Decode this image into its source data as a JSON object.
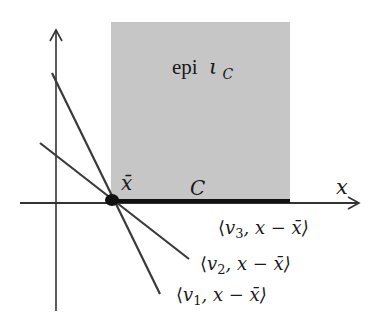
{
  "figure": {
    "colors": {
      "region_fill": "#c6c6c6",
      "line": "#3a3a3a",
      "axis": "#333333",
      "segment": "#111111",
      "point": "#111111",
      "text": "#1a1a1a"
    },
    "region": {
      "label_main": "epi",
      "label_symbol": "ι",
      "label_sub": "C",
      "x": 111,
      "y": 22,
      "width": 179,
      "height": 179
    },
    "axes": {
      "x_label": "x",
      "x_start": [
        20,
        203
      ],
      "x_end": [
        359,
        203
      ],
      "y_start": [
        56,
        311
      ],
      "y_end": [
        56,
        30
      ]
    },
    "set": {
      "label": "C",
      "segment_start": [
        112,
        201
      ],
      "segment_end": [
        290,
        201
      ]
    },
    "point": {
      "label": "x̄",
      "center": [
        112,
        200
      ]
    },
    "lines": [
      {
        "name": "v1",
        "label_open": "⟨",
        "label_var": "v",
        "label_sub": "1",
        "label_rest": ", x − x̄⟩",
        "start": [
          52,
          73
        ],
        "end": [
          160,
          294
        ]
      },
      {
        "name": "v2",
        "label_open": "⟨",
        "label_var": "v",
        "label_sub": "2",
        "label_rest": ", x − x̄⟩",
        "start": [
          40,
          143
        ],
        "end": [
          189,
          259
        ]
      },
      {
        "name": "v3",
        "label_open": "⟨",
        "label_var": "v",
        "label_sub": "3",
        "label_rest": ", x − x̄⟩"
      }
    ]
  }
}
